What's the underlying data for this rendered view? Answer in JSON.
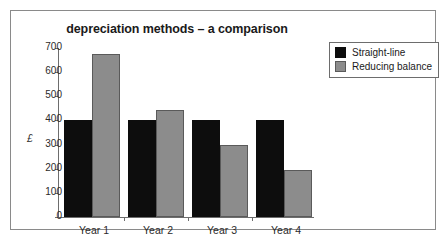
{
  "chart_data": {
    "type": "bar",
    "title": "depreciation methods – a comparison",
    "xlabel": "",
    "ylabel": "£",
    "categories": [
      "Year 1",
      "Year 2",
      "Year 3",
      "Year 4"
    ],
    "series": [
      {
        "name": "Straight-line",
        "color": "#0d0d0d",
        "values": [
          400,
          400,
          400,
          400
        ]
      },
      {
        "name": "Reducing balance",
        "color": "#8c8c8c",
        "values": [
          675,
          445,
          300,
          195
        ]
      }
    ],
    "ylim": [
      0,
      700
    ],
    "ytick_step": 100,
    "yticks": [
      700,
      600,
      500,
      400,
      300,
      200,
      100,
      0
    ],
    "ytick_labels": [
      "700",
      "600",
      "500",
      "400",
      "300",
      "200",
      "100",
      "0"
    ],
    "grid": false,
    "legend_position": "top-right"
  },
  "legend": {
    "entries": [
      {
        "label": "Straight-line"
      },
      {
        "label": "Reducing balance"
      }
    ]
  }
}
